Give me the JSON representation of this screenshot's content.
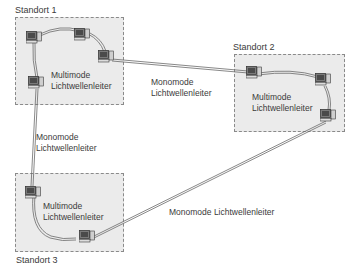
{
  "diagram": {
    "sites": [
      {
        "id": "site1",
        "title": "Standort 1",
        "inner_label": [
          "Multimode",
          "Lichtwellenleiter"
        ]
      },
      {
        "id": "site2",
        "title": "Standort 2",
        "inner_label": [
          "Multimode",
          "Lichtwellenleiter"
        ]
      },
      {
        "id": "site3",
        "title": "Standort 3",
        "inner_label": [
          "Multimode",
          "Lichtwellenleiter"
        ]
      }
    ],
    "links": [
      {
        "from": "site1",
        "to": "site2",
        "label": [
          "Monomode",
          "Lichtwellenleiter"
        ]
      },
      {
        "from": "site1",
        "to": "site3",
        "label": [
          "Monomode",
          "Lichtwellenleiter"
        ]
      },
      {
        "from": "site3",
        "to": "site2",
        "label": [
          "Monomode Lichtwellenleiter"
        ]
      }
    ],
    "icons": {
      "node": "computer-icon"
    },
    "colors": {
      "site_fill": "#ebebeb",
      "site_border": "#8a8a8a",
      "cable": "#6a6a6a",
      "text": "#3a3a3a"
    }
  }
}
